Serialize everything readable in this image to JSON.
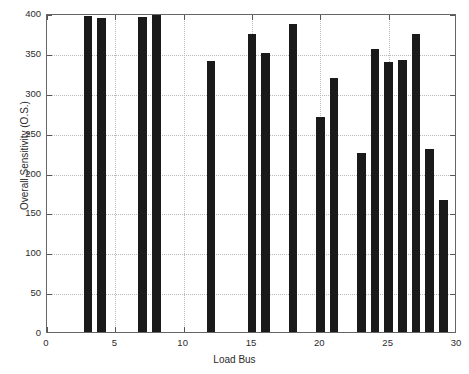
{
  "chart_data": {
    "type": "bar",
    "title": "",
    "subtitle": "",
    "xlabel": "Load Bus",
    "ylabel": "Overall Sensitivity (O.S.)",
    "xlim": [
      0,
      30
    ],
    "ylim": [
      0,
      400
    ],
    "xticks": [
      0,
      5,
      10,
      15,
      20,
      25,
      30
    ],
    "xtick_labels": [
      "0",
      "5",
      "10",
      "15",
      "20",
      "25",
      "30"
    ],
    "yticks": [
      0,
      50,
      100,
      150,
      200,
      250,
      300,
      350,
      400
    ],
    "ytick_labels": [
      "0",
      "50",
      "100",
      "150",
      "200",
      "250",
      "300",
      "350",
      "400"
    ],
    "grid": true,
    "grid_style": "dotted",
    "legend": null,
    "bar_color": "#1a1a1a",
    "background_color": "#ffffff",
    "axes_color": "#666666",
    "grid_color": "#b9b9b9",
    "bar_width": 0.62,
    "categories": [
      3,
      4,
      7,
      8,
      12,
      15,
      16,
      18,
      20,
      21,
      23,
      24,
      25,
      26,
      27,
      28,
      29
    ],
    "values": [
      396,
      394,
      395,
      400,
      340,
      374,
      350,
      386,
      269,
      319,
      225,
      355,
      339,
      341,
      374,
      230,
      165
    ],
    "points": [
      {
        "x": 3,
        "y": 396
      },
      {
        "x": 4,
        "y": 394
      },
      {
        "x": 7,
        "y": 395
      },
      {
        "x": 8,
        "y": 400
      },
      {
        "x": 12,
        "y": 340
      },
      {
        "x": 15,
        "y": 374
      },
      {
        "x": 16,
        "y": 350
      },
      {
        "x": 18,
        "y": 386
      },
      {
        "x": 20,
        "y": 269
      },
      {
        "x": 21,
        "y": 319
      },
      {
        "x": 23,
        "y": 225
      },
      {
        "x": 24,
        "y": 355
      },
      {
        "x": 25,
        "y": 339
      },
      {
        "x": 26,
        "y": 341
      },
      {
        "x": 27,
        "y": 374
      },
      {
        "x": 28,
        "y": 230
      },
      {
        "x": 29,
        "y": 165
      }
    ]
  }
}
